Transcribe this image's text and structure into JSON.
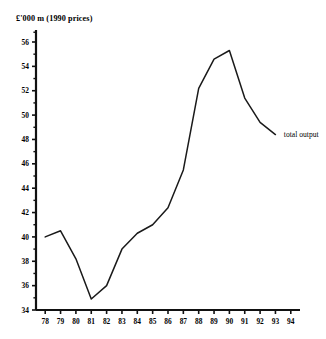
{
  "figure": {
    "unit_label": "£'000 m  (1990 prices)",
    "series_annotation": "total output"
  },
  "chart_data": {
    "type": "line",
    "title": "",
    "subtitle": "",
    "xlabel": "",
    "ylabel": "£'000 m  (1990 prices)",
    "grid": false,
    "legend_position": "inline-right-end-of-line",
    "xlim": [
      77.5,
      94.5
    ],
    "ylim": [
      34,
      56.8
    ],
    "ytick_labels": [
      "34",
      "36",
      "38",
      "40",
      "42",
      "44",
      "46",
      "48",
      "50",
      "52",
      "54",
      "56"
    ],
    "ytick_values": [
      34,
      36,
      38,
      40,
      42,
      44,
      46,
      48,
      50,
      52,
      54,
      56
    ],
    "yminor_values": [
      35,
      37,
      39,
      41,
      43,
      45,
      47,
      49,
      51,
      53,
      55
    ],
    "xtick_labels": [
      "78",
      "79",
      "80",
      "81",
      "82",
      "83",
      "84",
      "85",
      "86",
      "87",
      "88",
      "89",
      "90",
      "91",
      "92",
      "93",
      "94"
    ],
    "xtick_values": [
      78,
      79,
      80,
      81,
      82,
      83,
      84,
      85,
      86,
      87,
      88,
      89,
      90,
      91,
      92,
      93,
      94
    ],
    "categories": [
      78,
      79,
      80,
      81,
      82,
      83,
      84,
      85,
      86,
      87,
      88,
      89,
      90,
      91,
      92,
      93
    ],
    "series": [
      {
        "name": "total output",
        "x": [
          78,
          79,
          80,
          81,
          82,
          83,
          84,
          85,
          86,
          87,
          88,
          89,
          90,
          91,
          92,
          93
        ],
        "values": [
          40.0,
          40.5,
          38.2,
          34.9,
          36.0,
          39.0,
          40.3,
          41.0,
          42.4,
          45.5,
          52.2,
          54.6,
          55.3,
          51.4,
          49.4,
          48.4
        ]
      }
    ],
    "annotations": [
      {
        "text": "total output",
        "x": 93.35,
        "y": 48.4
      }
    ]
  }
}
